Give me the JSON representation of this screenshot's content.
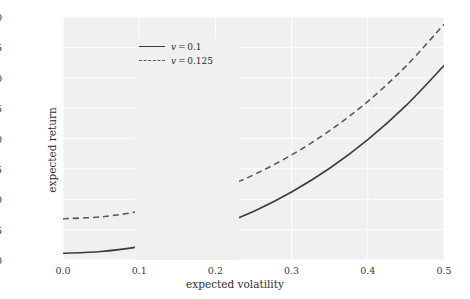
{
  "chart_data": {
    "type": "line",
    "title": "",
    "xlabel": "expected volatility",
    "ylabel": "expected return",
    "xlim": [
      0.0,
      0.5
    ],
    "ylim": [
      0.1,
      0.3
    ],
    "grid": true,
    "legend_position": "upper left",
    "xticks": [
      "0.0",
      "0.1",
      "0.2",
      "0.3",
      "0.4",
      "0.5"
    ],
    "xtick_values": [
      0.0,
      0.1,
      0.2,
      0.3,
      0.4,
      0.5
    ],
    "yticks": [
      "0.100",
      "0.125",
      "0.150",
      "0.175",
      "0.200",
      "0.225",
      "0.250",
      "0.275",
      "0.300"
    ],
    "ytick_values": [
      0.1,
      0.125,
      0.15,
      0.175,
      0.2,
      0.225,
      0.25,
      0.275,
      0.3
    ],
    "x": [
      0.0,
      0.05,
      0.1,
      0.15,
      0.2,
      0.25,
      0.3,
      0.35,
      0.4,
      0.45,
      0.5
    ],
    "series": [
      {
        "name": "v = 0.1",
        "label_var": "v",
        "label_value": "0.1",
        "style": "solid",
        "color": "#3c3c3c",
        "values": [
          0.1055,
          0.107,
          0.111,
          0.118,
          0.1275,
          0.14,
          0.156,
          0.1755,
          0.199,
          0.227,
          0.26
        ]
      },
      {
        "name": "v = 0.125",
        "label_var": "v",
        "label_value": "0.125",
        "style": "dashed",
        "color": "#585858",
        "values": [
          0.134,
          0.1355,
          0.14,
          0.147,
          0.157,
          0.17,
          0.1865,
          0.2065,
          0.2305,
          0.2595,
          0.294
        ]
      }
    ]
  },
  "figure": {
    "background": "#ffffff",
    "axes_background": "#f0f0f0",
    "grid_color": "#ffffff"
  }
}
